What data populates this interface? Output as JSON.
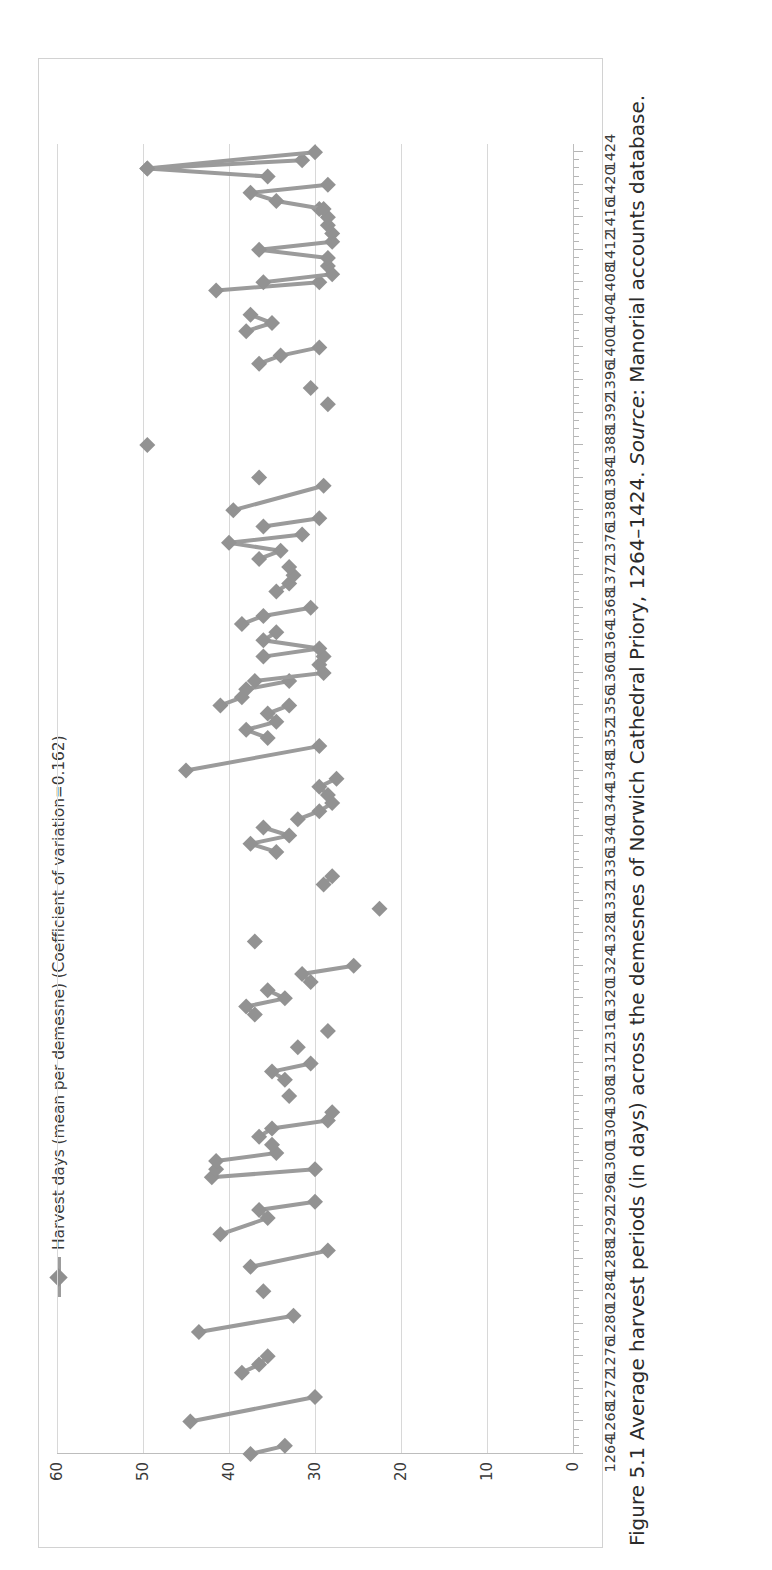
{
  "figure": {
    "caption_prefix": "Figure 5.1 Average harvest periods (in days) across the demesnes of Norwich Cathedral Priory, 1264–1424. ",
    "source_label": "Source",
    "caption_suffix": ": Manorial accounts database."
  },
  "legend": {
    "marker_icon": "diamond-marker-icon",
    "label": "Harvest days (mean per demesne) (Coefficient of variation=0.162)"
  },
  "chart_data": {
    "type": "line",
    "title": "",
    "xlabel": "",
    "ylabel": "",
    "orientation": "rotated-90-ccw",
    "grid": true,
    "legend_position": "top",
    "series_color": "#929292",
    "marker": "diamond",
    "xlim": [
      1264,
      1425
    ],
    "ylim": [
      0,
      60
    ],
    "yticks": [
      0,
      10,
      20,
      30,
      40,
      50,
      60
    ],
    "ytick_labels": [
      "0",
      "10",
      "20",
      "30",
      "40",
      "50",
      "60"
    ],
    "xtick_labels": [
      "1264",
      "1268",
      "1272",
      "1276",
      "1280",
      "1284",
      "1288",
      "1292",
      "1296",
      "1300",
      "1304",
      "1308",
      "1312",
      "1316",
      "1320",
      "1324",
      "1328",
      "1332",
      "1336",
      "1340",
      "1344",
      "1348",
      "1352",
      "1356",
      "1360",
      "1364",
      "1368",
      "1372",
      "1376",
      "1380",
      "1384",
      "1388",
      "1392",
      "1396",
      "1400",
      "1404",
      "1408",
      "1412",
      "1416",
      "1420",
      "1424"
    ],
    "xtick_step": 4,
    "xtick_minor_step": 1,
    "series": [
      {
        "name": "Harvest days (mean per demesne)",
        "coefficient_of_variation": 0.162,
        "segments": [
          [
            [
              1264,
              37.5
            ],
            [
              1265,
              33.5
            ]
          ],
          [
            [
              1268,
              44.5
            ],
            [
              1271,
              30.0
            ]
          ],
          [
            [
              1274,
              38.5
            ],
            [
              1275,
              36.5
            ],
            [
              1276,
              35.5
            ]
          ],
          [
            [
              1279,
              43.5
            ],
            [
              1281,
              32.5
            ]
          ],
          [
            [
              1284,
              36.0
            ]
          ],
          [
            [
              1287,
              37.5
            ],
            [
              1289,
              28.5
            ]
          ],
          [
            [
              1291,
              41.0
            ],
            [
              1293,
              35.5
            ],
            [
              1294,
              36.5
            ],
            [
              1295,
              30.0
            ]
          ],
          [
            [
              1298,
              42.0
            ],
            [
              1299,
              30.0
            ]
          ],
          [
            [
              1299,
              41.5
            ],
            [
              1300,
              41.5
            ],
            [
              1301,
              34.5
            ],
            [
              1302,
              35.0
            ]
          ],
          [
            [
              1303,
              36.5
            ],
            [
              1304,
              35.0
            ],
            [
              1305,
              28.5
            ],
            [
              1306,
              28.0
            ]
          ],
          [
            [
              1308,
              33.0
            ]
          ],
          [
            [
              1310,
              33.5
            ],
            [
              1311,
              35.0
            ],
            [
              1312,
              30.5
            ]
          ],
          [
            [
              1314,
              32.0
            ]
          ],
          [
            [
              1316,
              28.5
            ]
          ],
          [
            [
              1318,
              37.0
            ],
            [
              1319,
              38.0
            ],
            [
              1320,
              33.5
            ],
            [
              1321,
              35.5
            ]
          ],
          [
            [
              1322,
              30.5
            ],
            [
              1323,
              31.5
            ],
            [
              1324,
              25.5
            ]
          ],
          [
            [
              1327,
              37.0
            ]
          ],
          [
            [
              1331,
              22.5
            ]
          ],
          [
            [
              1334,
              29.0
            ],
            [
              1335,
              28.0
            ]
          ],
          [
            [
              1338,
              34.5
            ],
            [
              1339,
              37.5
            ],
            [
              1340,
              33.0
            ],
            [
              1341,
              36.0
            ]
          ],
          [
            [
              1342,
              32.0
            ],
            [
              1343,
              29.5
            ],
            [
              1344,
              28.0
            ],
            [
              1345,
              28.5
            ],
            [
              1346,
              29.5
            ],
            [
              1347,
              27.5
            ]
          ],
          [
            [
              1348,
              45.0
            ],
            [
              1351,
              29.5
            ]
          ],
          [
            [
              1352,
              35.5
            ],
            [
              1353,
              38.0
            ],
            [
              1354,
              34.5
            ],
            [
              1355,
              35.5
            ],
            [
              1356,
              33.0
            ]
          ],
          [
            [
              1356,
              41.0
            ],
            [
              1357,
              38.5
            ],
            [
              1358,
              38.0
            ],
            [
              1359,
              33.0
            ]
          ],
          [
            [
              1359,
              37.0
            ],
            [
              1360,
              29.0
            ],
            [
              1361,
              29.5
            ],
            [
              1362,
              29.0
            ]
          ],
          [
            [
              1362,
              36.0
            ],
            [
              1363,
              29.5
            ],
            [
              1364,
              36.0
            ],
            [
              1365,
              34.5
            ]
          ],
          [
            [
              1366,
              38.5
            ],
            [
              1367,
              36.0
            ],
            [
              1368,
              30.5
            ]
          ],
          [
            [
              1370,
              34.5
            ],
            [
              1371,
              33.0
            ],
            [
              1372,
              32.5
            ],
            [
              1373,
              33.0
            ]
          ],
          [
            [
              1374,
              36.5
            ],
            [
              1375,
              34.0
            ],
            [
              1376,
              40.0
            ],
            [
              1377,
              31.5
            ]
          ],
          [
            [
              1378,
              36.0
            ],
            [
              1379,
              29.5
            ]
          ],
          [
            [
              1380,
              39.5
            ],
            [
              1383,
              29.0
            ]
          ],
          [
            [
              1384,
              36.5
            ]
          ],
          [
            [
              1388,
              49.5
            ]
          ],
          [
            [
              1393,
              28.5
            ]
          ],
          [
            [
              1395,
              30.5
            ]
          ],
          [
            [
              1398,
              36.5
            ],
            [
              1399,
              34.0
            ],
            [
              1400,
              29.5
            ]
          ],
          [
            [
              1402,
              38.0
            ],
            [
              1403,
              35.0
            ],
            [
              1404,
              37.5
            ]
          ],
          [
            [
              1407,
              41.5
            ],
            [
              1408,
              29.5
            ]
          ],
          [
            [
              1408,
              36.0
            ],
            [
              1409,
              28.0
            ],
            [
              1410,
              28.5
            ]
          ],
          [
            [
              1411,
              28.5
            ],
            [
              1412,
              36.5
            ],
            [
              1413,
              28.0
            ]
          ],
          [
            [
              1414,
              28.0
            ],
            [
              1415,
              28.5
            ],
            [
              1416,
              28.5
            ],
            [
              1417,
              29.5
            ]
          ],
          [
            [
              1417,
              29.0
            ],
            [
              1418,
              34.5
            ],
            [
              1419,
              37.5
            ],
            [
              1420,
              28.5
            ]
          ],
          [
            [
              1421,
              35.5
            ],
            [
              1422,
              49.5
            ],
            [
              1423,
              31.5
            ]
          ],
          [
            [
              1422,
              49.5
            ],
            [
              1424,
              30.0
            ]
          ]
        ]
      }
    ]
  }
}
